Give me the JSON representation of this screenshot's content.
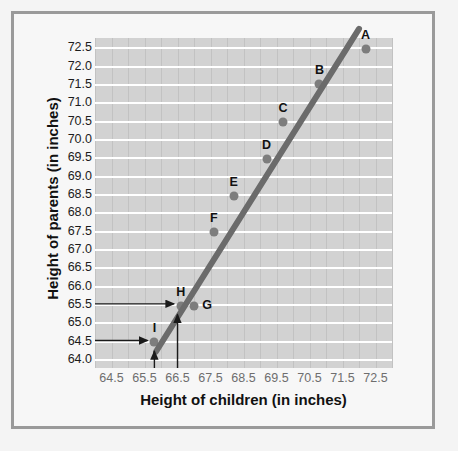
{
  "chart_data": {
    "type": "scatter",
    "title": "",
    "xlabel": "Height of children (in inches)",
    "ylabel": "Height of parents (in inches)",
    "xlim": [
      64.0,
      73.0
    ],
    "ylim": [
      63.75,
      72.75
    ],
    "xticks": [
      "64.5",
      "65.5",
      "66.5",
      "67.5",
      "68.5",
      "69.5",
      "70.5",
      "71.5",
      "72.5"
    ],
    "xtick_values": [
      64.5,
      65.5,
      66.5,
      67.5,
      68.5,
      69.5,
      70.5,
      71.5,
      72.5
    ],
    "yticks": [
      "72.5",
      "72.0",
      "71.5",
      "71.0",
      "70.5",
      "70.0",
      "69.5",
      "69.0",
      "68.5",
      "68.0",
      "67.5",
      "67.0",
      "66.5",
      "66.0",
      "65.5",
      "65.0",
      "64.5",
      "64.0"
    ],
    "ytick_values": [
      72.5,
      72.0,
      71.5,
      71.0,
      70.5,
      70.0,
      69.5,
      69.0,
      68.5,
      68.0,
      67.5,
      67.0,
      66.5,
      66.0,
      65.5,
      65.0,
      64.5,
      64.0
    ],
    "grid": true,
    "legend": "none",
    "points": [
      {
        "label": "A",
        "x": 72.2,
        "y": 72.45
      },
      {
        "label": "B",
        "x": 70.8,
        "y": 71.5
      },
      {
        "label": "C",
        "x": 69.7,
        "y": 70.45
      },
      {
        "label": "D",
        "x": 69.2,
        "y": 69.45
      },
      {
        "label": "E",
        "x": 68.2,
        "y": 68.45
      },
      {
        "label": "F",
        "x": 67.6,
        "y": 67.45
      },
      {
        "label": "G",
        "x": 67.0,
        "y": 65.45
      },
      {
        "label": "H",
        "x": 66.6,
        "y": 65.45
      },
      {
        "label": "I",
        "x": 65.8,
        "y": 64.45
      }
    ],
    "trend_line": {
      "type": "line-of-best-fit",
      "x_start": 65.85,
      "y_start": 64.2,
      "x_end": 72.0,
      "y_end": 73.0
    },
    "annotations": [
      {
        "name": "horizontal-arrow-65-5",
        "orientation": "horizontal",
        "from_axis": "y",
        "axis_value": 65.5,
        "points_to": "H"
      },
      {
        "name": "horizontal-arrow-64-5",
        "orientation": "horizontal",
        "from_axis": "y",
        "axis_value": 64.5,
        "points_to": "I"
      },
      {
        "name": "vertical-arrow-66-5",
        "orientation": "vertical",
        "from_axis": "x",
        "axis_value": 66.5,
        "points_to": "H"
      },
      {
        "name": "vertical-arrow-65-8",
        "orientation": "vertical",
        "from_axis": "x",
        "axis_value": 65.8,
        "points_to": "I"
      }
    ],
    "colors": {
      "panel_background": "#d2d2d2",
      "gridline_white": "#ffffff",
      "gridline_gray": "#c2c2c2",
      "point": "#7d7d7d",
      "trend_line": "#6b6b6b",
      "annotation_arrow": "#1a1a1a",
      "frame": "#9a9a9a",
      "page_background": "#f4f4f4"
    }
  }
}
